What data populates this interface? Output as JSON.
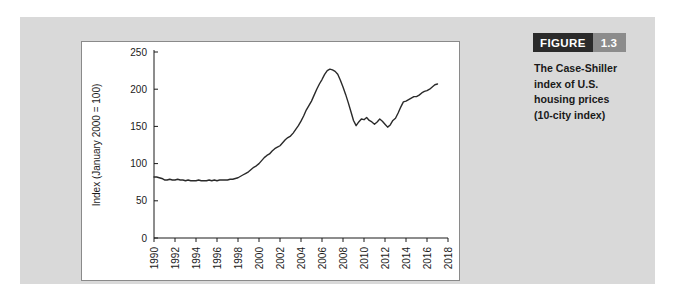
{
  "figure": {
    "tag_word": "FIGURE",
    "tag_number": "1.3",
    "caption_lines": [
      "The Case-Shiller",
      "index of U.S.",
      "housing prices",
      "(10-city index)"
    ],
    "tag_word_bg": "#2b2b2b",
    "tag_number_bg": "#8c8c8c",
    "panel_bg": "#d9d9d9",
    "line_color": "#2a2a2a"
  },
  "chart_data": {
    "type": "line",
    "title": "",
    "xlabel": "",
    "ylabel": "Index (January 2000 = 100)",
    "xlim": [
      1990,
      2018
    ],
    "ylim": [
      0,
      250
    ],
    "grid": false,
    "legend": "none",
    "ytick_labels": [
      "0",
      "50",
      "100",
      "150",
      "200",
      "250"
    ],
    "yticks": [
      0,
      50,
      100,
      150,
      200,
      250
    ],
    "xtick_labels": [
      "1990",
      "1992",
      "1994",
      "1996",
      "1998",
      "2000",
      "2002",
      "2004",
      "2006",
      "2008",
      "2010",
      "2012",
      "2014",
      "2016",
      "2018"
    ],
    "xticks": [
      1990,
      1992,
      1994,
      1996,
      1998,
      2000,
      2002,
      2004,
      2006,
      2008,
      2010,
      2012,
      2014,
      2016,
      2018
    ],
    "series": [
      {
        "name": "Case-Shiller 10-city index",
        "x": [
          1990.0,
          1990.25,
          1990.5,
          1990.75,
          1991.0,
          1991.25,
          1991.5,
          1991.75,
          1992.0,
          1992.25,
          1992.5,
          1992.75,
          1993.0,
          1993.25,
          1993.5,
          1993.75,
          1994.0,
          1994.25,
          1994.5,
          1994.75,
          1995.0,
          1995.25,
          1995.5,
          1995.75,
          1996.0,
          1996.25,
          1996.5,
          1996.75,
          1997.0,
          1997.25,
          1997.5,
          1997.75,
          1998.0,
          1998.25,
          1998.5,
          1998.75,
          1999.0,
          1999.25,
          1999.5,
          1999.75,
          2000.0,
          2000.25,
          2000.5,
          2000.75,
          2001.0,
          2001.25,
          2001.5,
          2001.75,
          2002.0,
          2002.25,
          2002.5,
          2002.75,
          2003.0,
          2003.25,
          2003.5,
          2003.75,
          2004.0,
          2004.25,
          2004.5,
          2004.75,
          2005.0,
          2005.25,
          2005.5,
          2005.75,
          2006.0,
          2006.25,
          2006.5,
          2006.75,
          2007.0,
          2007.25,
          2007.5,
          2007.75,
          2008.0,
          2008.25,
          2008.5,
          2008.75,
          2009.0,
          2009.25,
          2009.5,
          2009.75,
          2010.0,
          2010.25,
          2010.5,
          2010.75,
          2011.0,
          2011.25,
          2011.5,
          2011.75,
          2012.0,
          2012.25,
          2012.5,
          2012.75,
          2013.0,
          2013.25,
          2013.5,
          2013.75,
          2014.0,
          2014.25,
          2014.5,
          2014.75,
          2015.0,
          2015.25,
          2015.5,
          2015.75,
          2016.0,
          2016.25,
          2016.5,
          2016.75,
          2017.0
        ],
        "values": [
          82,
          82,
          81,
          80,
          78,
          78,
          79,
          78,
          78,
          79,
          78,
          78,
          77,
          78,
          77,
          77,
          77,
          78,
          77,
          77,
          77,
          78,
          77,
          78,
          77,
          78,
          78,
          78,
          78,
          79,
          79,
          80,
          81,
          83,
          85,
          87,
          89,
          92,
          95,
          97,
          100,
          104,
          108,
          111,
          113,
          117,
          120,
          122,
          124,
          128,
          132,
          135,
          137,
          141,
          146,
          151,
          157,
          164,
          172,
          178,
          184,
          192,
          200,
          207,
          213,
          220,
          225,
          227,
          226,
          224,
          220,
          212,
          203,
          193,
          182,
          170,
          158,
          151,
          156,
          160,
          159,
          162,
          158,
          156,
          153,
          156,
          160,
          157,
          153,
          149,
          152,
          158,
          161,
          168,
          176,
          183,
          184,
          186,
          188,
          190,
          190,
          192,
          195,
          197,
          198,
          200,
          203,
          206,
          207
        ]
      }
    ]
  }
}
